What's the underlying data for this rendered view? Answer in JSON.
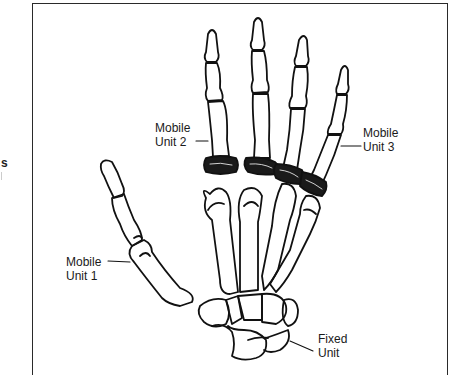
{
  "figure": {
    "edge_text": "s",
    "labels": [
      {
        "id": "mobile-unit-2",
        "line1": "Mobile",
        "line2": "Unit 2"
      },
      {
        "id": "mobile-unit-3",
        "line1": "Mobile",
        "line2": "Unit 3"
      },
      {
        "id": "mobile-unit-1",
        "line1": "Mobile",
        "line2": "Unit 1"
      },
      {
        "id": "fixed-unit",
        "line1": "Fixed",
        "line2": "Unit"
      }
    ]
  },
  "colors": {
    "ink": "#111111",
    "paper": "#ffffff",
    "frame": "#2a2a2a"
  }
}
